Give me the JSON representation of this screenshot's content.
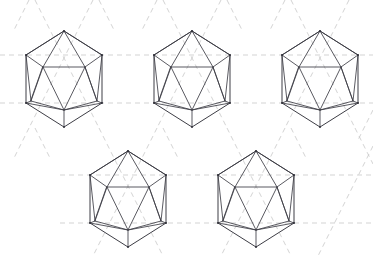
{
  "figure": {
    "canvas": {
      "width": 373,
      "height": 268
    },
    "background_color": "#ffffff",
    "solid_line_color": "#3c3c44",
    "dashed_line_color": "#c8c8c8",
    "vertex_dot_color": "#2e2e36",
    "shape_count": 5,
    "rows": [
      {
        "label": "top-row",
        "count": 3
      },
      {
        "label": "bottom-row",
        "count": 2
      }
    ]
  },
  "lattice": {
    "type": "triangular",
    "dash_pattern": "5 4",
    "stroke_width": 0.8,
    "horizontal_rows_y": [
      55,
      103,
      175,
      223
    ],
    "cell_width": 128,
    "cell_height": 72,
    "diagonal_slope": 0.5625
  },
  "shapes": [
    {
      "name": "icosahedron-1",
      "row": "top-row",
      "index": 0,
      "center": {
        "x": 64,
        "y": 79
      },
      "radius_x": 38,
      "radius_y": 48,
      "top_apex": {
        "x": 64,
        "y": 31
      },
      "bottom_apex": {
        "x": 64,
        "y": 127
      }
    },
    {
      "name": "icosahedron-2",
      "row": "top-row",
      "index": 1,
      "center": {
        "x": 192,
        "y": 79
      },
      "radius_x": 38,
      "radius_y": 48,
      "top_apex": {
        "x": 192,
        "y": 31
      },
      "bottom_apex": {
        "x": 192,
        "y": 127
      }
    },
    {
      "name": "icosahedron-3",
      "row": "top-row",
      "index": 2,
      "center": {
        "x": 320,
        "y": 79
      },
      "radius_x": 38,
      "radius_y": 48,
      "top_apex": {
        "x": 320,
        "y": 31
      },
      "bottom_apex": {
        "x": 320,
        "y": 127
      }
    },
    {
      "name": "icosahedron-4",
      "row": "bottom-row",
      "index": 0,
      "center": {
        "x": 128,
        "y": 199
      },
      "radius_x": 38,
      "radius_y": 48,
      "top_apex": {
        "x": 128,
        "y": 151
      },
      "bottom_apex": {
        "x": 128,
        "y": 247
      }
    },
    {
      "name": "icosahedron-5",
      "row": "bottom-row",
      "index": 1,
      "center": {
        "x": 256,
        "y": 199
      },
      "radius_x": 38,
      "radius_y": 48,
      "top_apex": {
        "x": 256,
        "y": 151
      },
      "bottom_apex": {
        "x": 256,
        "y": 247
      }
    }
  ],
  "geometry_notes": {
    "outline": "irregular hexagon: top apex, upper-left, lower-left, bottom apex, lower-right, upper-right",
    "inner_structure": "inner hexagon of 6 vertices connected to outline vertices forming 20 triangular faces",
    "projection": "orthographic projection of a regular icosahedron viewed along a 2-fold axis"
  }
}
